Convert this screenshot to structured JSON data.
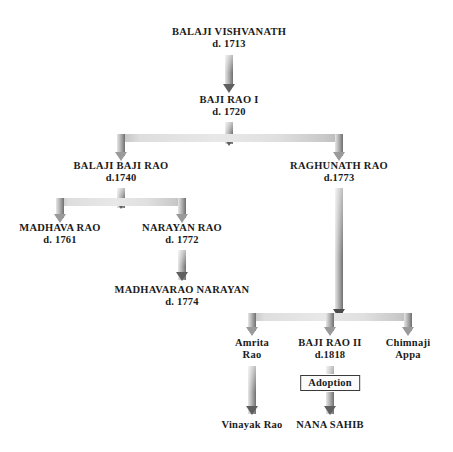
{
  "diagram": {
    "background_color": "#ffffff",
    "text_color": "#1b1b1b",
    "connector_color": "#b0b0b0",
    "arrow_color": "#5f5f5f"
  },
  "nodes": {
    "balaji_vishvanath": {
      "name": "BALAJI VISHVANATH",
      "death": "d. 1713"
    },
    "baji_rao_i": {
      "name": "BAJI RAO I",
      "death": "d. 1720"
    },
    "balaji_baji_rao": {
      "name": "BALAJI BAJI RAO",
      "death": "d.1740"
    },
    "raghunath_rao": {
      "name": "RAGHUNATH RAO",
      "death": "d.1773"
    },
    "madhava_rao": {
      "name": "MADHAVA RAO",
      "death": "d. 1761"
    },
    "narayan_rao": {
      "name": "NARAYAN RAO",
      "death": "d. 1772"
    },
    "madhavarao_narayan": {
      "name": "MADHAVARAO NARAYAN",
      "death": "d. 1774"
    },
    "amrita_rao": {
      "name": "Amrita",
      "name2": "Rao",
      "death": ""
    },
    "baji_rao_ii": {
      "name": "BAJI RAO II",
      "death": "d.1818"
    },
    "chimnaji_appa": {
      "name": "Chimnaji",
      "name2": "Appa",
      "death": ""
    },
    "vinayak_rao": {
      "name": "Vinayak Rao",
      "death": ""
    },
    "nana_sahib": {
      "name": "NANA SAHIB",
      "death": ""
    }
  },
  "annotations": {
    "adoption_label": "Adoption"
  }
}
